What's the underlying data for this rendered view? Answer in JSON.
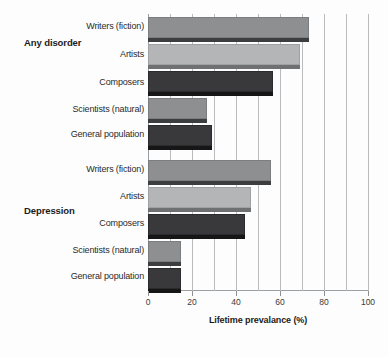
{
  "chart_data": {
    "type": "bar",
    "orientation": "horizontal",
    "title": "",
    "xlabel": "Lifetime prevalance (%)",
    "ylabel": "",
    "xlim": [
      0,
      100
    ],
    "xticks": [
      0,
      20,
      40,
      60,
      80,
      100
    ],
    "xtick_labels": [
      "0",
      "20",
      "40",
      "60",
      "80",
      "100"
    ],
    "gridline_step": 10,
    "grid": true,
    "legend": "none",
    "groups": [
      {
        "name": "Any disorder",
        "categories": [
          "Writers (fiction)",
          "Artists",
          "Composers",
          "Scientists (natural)",
          "General population"
        ],
        "values": [
          73,
          69,
          57,
          27,
          29
        ]
      },
      {
        "name": "Depression",
        "categories": [
          "Writers (fiction)",
          "Artists",
          "Composers",
          "Scientists (natural)",
          "General population"
        ],
        "values": [
          56,
          47,
          44,
          15,
          15
        ]
      }
    ],
    "colors": {
      "shade_a": "#8d8f91",
      "shade_b": "#b3b5b6",
      "shade_c": "#39393b",
      "gridline": "#b9bcbe",
      "axis": "#9aa0a3",
      "text": "#2a2a2a"
    }
  }
}
